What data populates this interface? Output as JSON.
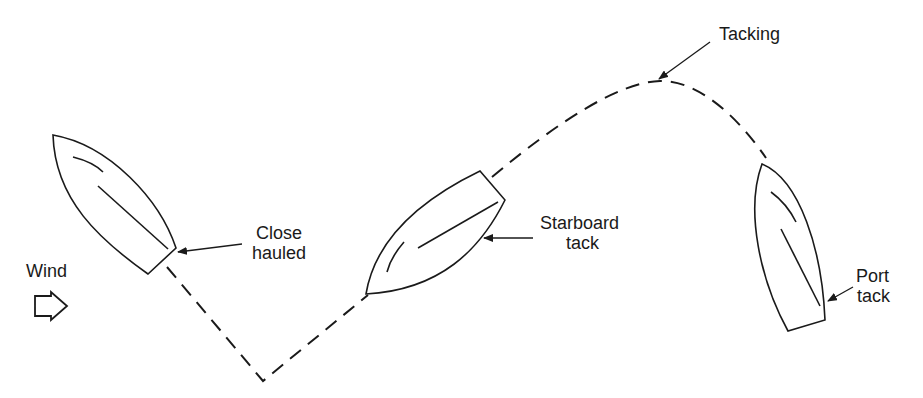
{
  "diagram": {
    "title": "",
    "colors": {
      "stroke": "#1a1a1a",
      "background": "#ffffff"
    },
    "labels": {
      "wind": "Wind",
      "close_hauled_1": "Close",
      "close_hauled_2": "hauled",
      "starboard_1": "Starboard",
      "starboard_2": "tack",
      "tacking": "Tacking",
      "port_1": "Port",
      "port_2": "tack"
    },
    "nodes": [
      {
        "id": "boat-close-hauled",
        "label": "Close hauled"
      },
      {
        "id": "boat-starboard-tack",
        "label": "Starboard tack"
      },
      {
        "id": "tacking-point",
        "label": "Tacking"
      },
      {
        "id": "boat-port-tack",
        "label": "Port tack"
      },
      {
        "id": "wind-arrow",
        "label": "Wind"
      }
    ],
    "edges": [
      {
        "from": "boat-close-hauled",
        "to": "boat-starboard-tack",
        "style": "dashed"
      },
      {
        "from": "boat-starboard-tack",
        "to": "tacking-point",
        "style": "dashed"
      },
      {
        "from": "tacking-point",
        "to": "boat-port-tack",
        "style": "dashed"
      }
    ]
  }
}
